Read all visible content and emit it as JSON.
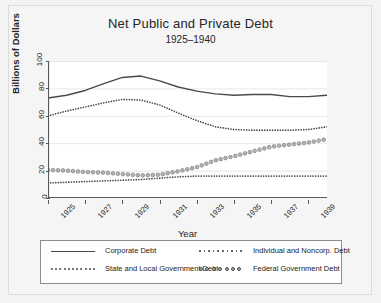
{
  "chart_data": {
    "type": "line",
    "title": "Net Public and Private Debt",
    "subtitle": "1925–1940",
    "xlabel": "Year",
    "ylabel": "Billions of Dollars",
    "xlim": [
      1925,
      1940
    ],
    "ylim": [
      0,
      100
    ],
    "yticks": [
      0,
      20,
      40,
      60,
      80,
      100
    ],
    "ytick_labels": [
      "0",
      "20",
      "40",
      "60",
      "80",
      "100"
    ],
    "xticks": [
      1925,
      1927,
      1929,
      1931,
      1933,
      1935,
      1937,
      1939
    ],
    "xtick_labels": [
      "1925",
      "1927",
      "1929",
      "1931",
      "1933",
      "1935",
      "1937",
      "1939"
    ],
    "grid": "horizontal",
    "legend_position": "bottom",
    "x": [
      1925,
      1926,
      1927,
      1928,
      1929,
      1930,
      1931,
      1932,
      1933,
      1934,
      1935,
      1936,
      1937,
      1938,
      1939,
      1940
    ],
    "series": [
      {
        "name": "Corporate Debt",
        "style": "solid",
        "color": "#4a4a4a",
        "values": [
          73.0,
          75.0,
          78.5,
          83.5,
          88.0,
          89.0,
          85.5,
          81.0,
          78.0,
          76.0,
          75.0,
          75.5,
          75.5,
          74.0,
          74.0,
          75.0
        ]
      },
      {
        "name": "Individual and Noncorp. Debt",
        "style": "fine-dotted",
        "color": "#4a4a4a",
        "values": [
          60.0,
          63.5,
          66.5,
          69.5,
          72.0,
          71.5,
          68.0,
          62.0,
          56.5,
          52.0,
          50.0,
          49.5,
          49.5,
          49.5,
          50.0,
          52.0
        ]
      },
      {
        "name": "State and Local Government Debt",
        "style": "dotted",
        "color": "#4a4a4a",
        "values": [
          11.0,
          11.5,
          12.0,
          12.5,
          13.0,
          13.5,
          14.5,
          15.5,
          16.0,
          16.0,
          16.0,
          16.0,
          16.0,
          16.0,
          16.0,
          16.0
        ]
      },
      {
        "name": "Federal Government Debt",
        "style": "circle-dotted",
        "color": "#808080",
        "values": [
          20.5,
          20.0,
          19.0,
          18.5,
          17.5,
          16.5,
          17.0,
          19.5,
          22.5,
          27.5,
          30.5,
          34.0,
          37.5,
          39.0,
          40.5,
          43.0
        ]
      }
    ]
  },
  "legend": {
    "items": [
      {
        "label": "Corporate Debt",
        "key": "solid"
      },
      {
        "label": "Individual and Noncorp. Debt",
        "key": "fine-dotted"
      },
      {
        "label": "State and Local Government Debt",
        "key": "dotted"
      },
      {
        "label": "Federal Government Debt",
        "key": "circle-dotted"
      }
    ]
  },
  "colors": {
    "plot_background": "#ffffff",
    "figure_background": "#f3f3f3",
    "grid": "#e8e8e8",
    "axis": "#595959",
    "line": "#4a4a4a",
    "federal_marker": "#808080"
  }
}
